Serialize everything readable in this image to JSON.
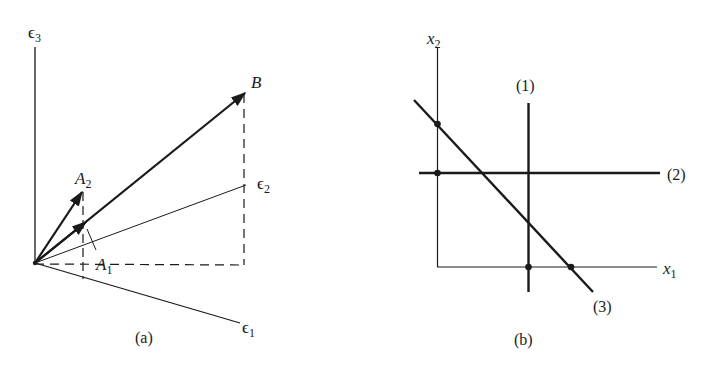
{
  "figure_a": {
    "caption": "(a)",
    "axes": {
      "e1": "ϵ",
      "e1_sub": "1",
      "e2": "ϵ",
      "e2_sub": "2",
      "e3": "ϵ",
      "e3_sub": "3"
    },
    "vectors": {
      "B": "B",
      "A1": "A",
      "A1_sub": "1",
      "A2": "A",
      "A2_sub": "2"
    }
  },
  "figure_b": {
    "caption": "(b)",
    "axes": {
      "x1": "x",
      "x1_sub": "1",
      "x2": "x",
      "x2_sub": "2"
    },
    "lines": {
      "l1": "(1)",
      "l2": "(2)",
      "l3": "(3)"
    }
  },
  "colors": {
    "ink": "#1a1a1a",
    "background": "#ffffff"
  }
}
